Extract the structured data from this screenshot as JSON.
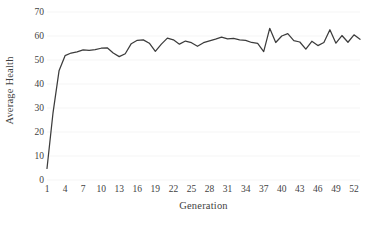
{
  "chart_data": {
    "type": "line",
    "title": "",
    "xlabel": "Generation",
    "ylabel": "Average Health",
    "xlim": [
      1,
      53
    ],
    "ylim": [
      0,
      70
    ],
    "grid": true,
    "grid_axis": "y",
    "legend": "none",
    "line_color": "#3c3c3c",
    "background_color": "#ffffff",
    "y_ticks": [
      0,
      10,
      20,
      30,
      40,
      50,
      60,
      70
    ],
    "y_tick_labels": [
      "0",
      "10",
      "20",
      "30",
      "40",
      "50",
      "60",
      "70"
    ],
    "x_ticks": [
      1,
      4,
      7,
      10,
      13,
      16,
      19,
      22,
      25,
      28,
      31,
      34,
      37,
      40,
      43,
      46,
      49,
      52
    ],
    "x_tick_labels": [
      "1",
      "4",
      "7",
      "10",
      "13",
      "16",
      "19",
      "22",
      "25",
      "28",
      "31",
      "34",
      "37",
      "40",
      "43",
      "46",
      "49",
      "52"
    ],
    "series": [
      {
        "name": "Average Health",
        "x": [
          1,
          2,
          3,
          4,
          5,
          6,
          7,
          8,
          9,
          10,
          11,
          12,
          13,
          14,
          15,
          16,
          17,
          18,
          19,
          20,
          21,
          22,
          23,
          24,
          25,
          26,
          27,
          28,
          29,
          30,
          31,
          32,
          33,
          34,
          35,
          36,
          37,
          38,
          39,
          40,
          41,
          42,
          43,
          44,
          45,
          46,
          47,
          48,
          49,
          50,
          51,
          52,
          53
        ],
        "values": [
          4.8,
          28.0,
          45.5,
          51.8,
          52.9,
          53.4,
          54.2,
          54.0,
          54.3,
          54.9,
          55.1,
          52.9,
          51.4,
          52.6,
          56.8,
          58.2,
          58.4,
          57.0,
          53.6,
          56.6,
          59.1,
          58.4,
          56.6,
          57.9,
          57.2,
          55.7,
          57.2,
          58.0,
          58.7,
          59.5,
          58.8,
          59.0,
          58.4,
          58.2,
          57.3,
          56.9,
          53.5,
          63.2,
          57.3,
          60.0,
          61.0,
          58.1,
          57.5,
          54.5,
          57.8,
          56.0,
          57.3,
          62.6,
          57.0,
          60.2,
          57.4,
          60.5,
          58.6
        ]
      }
    ]
  }
}
